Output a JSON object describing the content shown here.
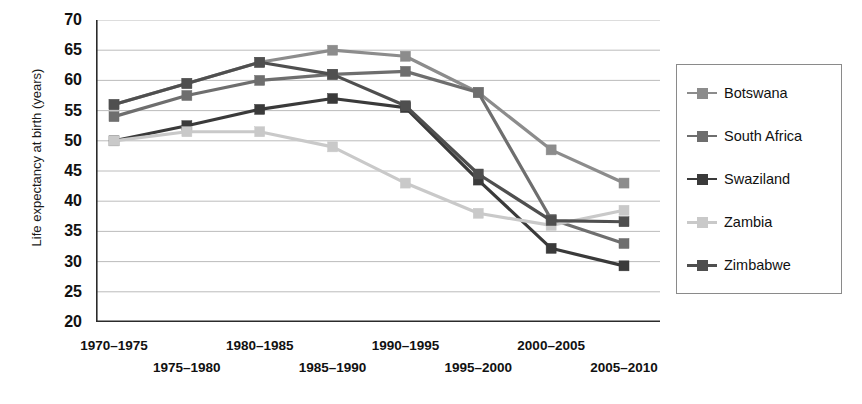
{
  "chart_data": {
    "type": "line",
    "title": "",
    "xlabel": "",
    "ylabel": "Life expectancy at birth (years)",
    "ylim": [
      20,
      70
    ],
    "ytick_step": 5,
    "yticks": [
      70,
      65,
      60,
      55,
      50,
      45,
      40,
      35,
      30,
      25,
      20
    ],
    "grid": true,
    "legend_position": "right",
    "categories": [
      "1970–1975",
      "1975–1980",
      "1980–1985",
      "1985–1990",
      "1990–1995",
      "1995–2000",
      "2000–2005",
      "2005–2010"
    ],
    "series": [
      {
        "name": "Botswana",
        "color": "#8c8c8c",
        "values": [
          56,
          59.5,
          63,
          65,
          64,
          58,
          48.5,
          43
        ]
      },
      {
        "name": "South Africa",
        "color": "#6e6e6e",
        "values": [
          54,
          57.5,
          60,
          61,
          61.5,
          58,
          37,
          33
        ]
      },
      {
        "name": "Swaziland",
        "color": "#3a3a3a",
        "values": [
          50,
          52.5,
          55.2,
          57,
          55.5,
          43.5,
          32.2,
          29.3
        ]
      },
      {
        "name": "Zambia",
        "color": "#c9c9c9",
        "values": [
          50,
          51.5,
          51.5,
          49,
          43,
          38,
          36,
          38.5
        ]
      },
      {
        "name": "Zimbabwe",
        "color": "#4f4f4f",
        "values": [
          56,
          59.5,
          63,
          61,
          55.8,
          44.5,
          36.8,
          36.6
        ]
      }
    ]
  },
  "legend": {
    "items": [
      {
        "label": "Botswana"
      },
      {
        "label": "South Africa"
      },
      {
        "label": "Swaziland"
      },
      {
        "label": "Zambia"
      },
      {
        "label": "Zimbabwe"
      }
    ]
  },
  "axes": {
    "y_title": "Life expectancy at birth (years)"
  }
}
